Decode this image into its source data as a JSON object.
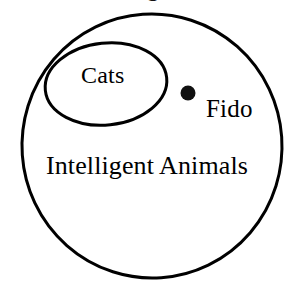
{
  "diagram": {
    "type": "euler-diagram",
    "background_color": "#ffffff",
    "stroke_color": "#000000",
    "outer_set": {
      "label": "Intelligent Animals",
      "shape": "circle",
      "center": {
        "x": 152,
        "y": 146
      },
      "radius_x": 130,
      "radius_y": 132,
      "stroke_width": 3
    },
    "inner_set": {
      "label": "Cats",
      "shape": "ellipse",
      "center": {
        "x": 106,
        "y": 84
      },
      "radius_x": 61,
      "radius_y": 41,
      "stroke_width": 3
    },
    "member_point": {
      "label": "Fido",
      "marker": "filled-dot",
      "center": {
        "x": 188,
        "y": 93
      },
      "radius": 7.5,
      "fill": "#111111"
    },
    "clipped_header_text": "g"
  }
}
